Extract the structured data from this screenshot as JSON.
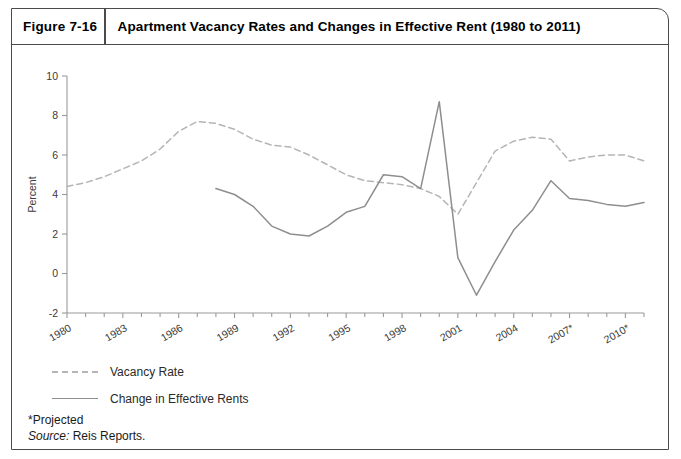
{
  "figure": {
    "label": "Figure 7-16",
    "title": "Apartment Vacancy Rates and Changes in Effective Rent (1980 to 2011)"
  },
  "legend": {
    "items": [
      {
        "label": "Vacancy Rate",
        "style": "dashed",
        "color": "#b5b5b5"
      },
      {
        "label": "Change in Effective Rents",
        "style": "solid",
        "color": "#8e8e8e"
      }
    ]
  },
  "footnotes": {
    "projected": "*Projected",
    "source_prefix": "Source:",
    "source_text": "Reis Reports."
  },
  "chart_data": {
    "type": "line",
    "title": "Apartment Vacancy Rates and Changes in Effective Rent (1980 to 2011)",
    "xlabel": "",
    "ylabel": "Percent",
    "ylim": [
      -2,
      10
    ],
    "yticks": [
      -2,
      0,
      2,
      4,
      6,
      8,
      10
    ],
    "xlim": [
      1980,
      2011
    ],
    "xticks": [
      1980,
      1983,
      1986,
      1989,
      1992,
      1995,
      1998,
      2001,
      2004,
      2007,
      2010
    ],
    "xtick_labels": [
      "1980",
      "1983",
      "1986",
      "1989",
      "1992",
      "1995",
      "1998",
      "2001",
      "2004",
      "2007*",
      "2010*"
    ],
    "grid": false,
    "legend_position": "below-left",
    "x": [
      1980,
      1981,
      1982,
      1983,
      1984,
      1985,
      1986,
      1987,
      1988,
      1989,
      1990,
      1991,
      1992,
      1993,
      1994,
      1995,
      1996,
      1997,
      1998,
      1999,
      2000,
      2001,
      2002,
      2003,
      2004,
      2005,
      2006,
      2007,
      2008,
      2009,
      2010,
      2011
    ],
    "series": [
      {
        "name": "Vacancy Rate",
        "style": "dashed",
        "color": "#b5b5b5",
        "values": [
          4.4,
          4.6,
          4.9,
          5.3,
          5.7,
          6.3,
          7.2,
          7.7,
          7.6,
          7.3,
          6.8,
          6.5,
          6.4,
          6.0,
          5.5,
          5.0,
          4.7,
          4.6,
          4.5,
          4.3,
          3.9,
          3.0,
          4.6,
          6.2,
          6.7,
          6.9,
          6.8,
          5.7,
          5.9,
          6.0,
          6.0,
          5.7
        ]
      },
      {
        "name": "Change in Effective Rents",
        "style": "solid",
        "color": "#8e8e8e",
        "values": [
          null,
          null,
          null,
          null,
          null,
          null,
          null,
          null,
          4.3,
          4.0,
          3.4,
          2.4,
          2.0,
          1.9,
          2.4,
          3.1,
          3.4,
          5.0,
          4.9,
          4.3,
          8.7,
          0.8,
          -1.1,
          0.6,
          2.2,
          3.2,
          4.7,
          3.8,
          3.7,
          3.5,
          3.4,
          3.6
        ]
      }
    ]
  }
}
